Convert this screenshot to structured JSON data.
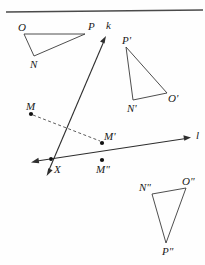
{
  "figure": {
    "background_color": "#fefefe",
    "ink_color": "#2e2e2e",
    "top_rule": {
      "x1": 6,
      "y1": 12,
      "x2": 203,
      "y2": 10
    },
    "labels": {
      "O": "O",
      "N": "N",
      "P": "P",
      "k": "k",
      "P_prime": "P'",
      "N_prime": "N'",
      "O_prime": "O'",
      "M": "M",
      "M_prime": "M'",
      "M_double": "M\"",
      "X": "X",
      "l": "l",
      "N_double": "N\"",
      "O_double": "O\"",
      "P_double": "P\""
    },
    "label_positions": {
      "O": {
        "x": 18,
        "y": 31
      },
      "N": {
        "x": 30,
        "y": 68
      },
      "P": {
        "x": 88,
        "y": 30
      },
      "k": {
        "x": 106,
        "y": 29
      },
      "P_prime": {
        "x": 122,
        "y": 44
      },
      "N_prime": {
        "x": 127,
        "y": 112
      },
      "O_prime": {
        "x": 168,
        "y": 102
      },
      "M": {
        "x": 26,
        "y": 110
      },
      "M_prime": {
        "x": 104,
        "y": 140
      },
      "M_double": {
        "x": 99,
        "y": 172
      },
      "X": {
        "x": 54,
        "y": 173
      },
      "l": {
        "x": 196,
        "y": 138
      },
      "N_double": {
        "x": 142,
        "y": 190
      },
      "O_double": {
        "x": 184,
        "y": 184
      },
      "P_double": {
        "x": 165,
        "y": 254
      }
    },
    "triangle_onp": {
      "name": "triangle-ONP",
      "vertices": [
        {
          "label": "O",
          "x": 24,
          "y": 34
        },
        {
          "label": "P",
          "x": 85,
          "y": 34
        },
        {
          "label": "N",
          "x": 34,
          "y": 56
        }
      ]
    },
    "triangle_image_one": {
      "name": "triangle-P-prime-N-prime-O-prime",
      "vertices": [
        {
          "label": "P'",
          "x": 126,
          "y": 47
        },
        {
          "label": "N'",
          "x": 133,
          "y": 100
        },
        {
          "label": "O'",
          "x": 167,
          "y": 93
        }
      ]
    },
    "triangle_image_two": {
      "name": "triangle-N-double-O-double-P-double",
      "vertices": [
        {
          "label": "N\"",
          "x": 152,
          "y": 194
        },
        {
          "label": "O\"",
          "x": 186,
          "y": 188
        },
        {
          "label": "P\"",
          "x": 166,
          "y": 243
        }
      ]
    },
    "line_k": {
      "name": "line-k",
      "from": {
        "x": 47,
        "y": 174
      },
      "to": {
        "x": 106,
        "y": 36
      },
      "arrows": "both"
    },
    "line_l": {
      "name": "line-l",
      "from": {
        "x": 32,
        "y": 162
      },
      "to": {
        "x": 190,
        "y": 138
      },
      "arrows": "both"
    },
    "dashed_segment": {
      "name": "segment-M-to-M-prime",
      "from": {
        "x": 31,
        "y": 114
      },
      "to": {
        "x": 102,
        "y": 142
      }
    },
    "points": [
      {
        "label": "M",
        "x": 31,
        "y": 114
      },
      {
        "label": "M'",
        "x": 102,
        "y": 143
      },
      {
        "label": "M\"",
        "x": 102,
        "y": 160
      },
      {
        "label": "X",
        "x": 51,
        "y": 159
      }
    ]
  }
}
